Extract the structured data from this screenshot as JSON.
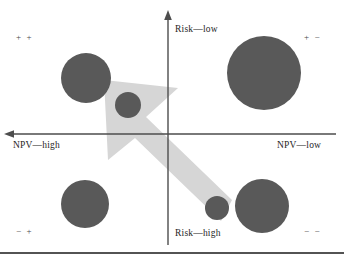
{
  "figure": {
    "title": "",
    "background": "#ffffff",
    "width": 344,
    "height": 263
  },
  "axes": {
    "vertical": {
      "label_top": "Risk—low",
      "label_bottom": "Risk—high",
      "color": "#4d4d4d",
      "x": 168,
      "y_top": 14,
      "y_bottom": 245,
      "arrow_at": "top"
    },
    "horizontal": {
      "label_left": "NPV—high",
      "label_right": "NPV—low",
      "color": "#4d4d4d",
      "y": 134,
      "x_left": 8,
      "x_right": 336,
      "arrow_at": "left"
    }
  },
  "quadrant_signs": {
    "top_left": "+ +",
    "top_right": "+ −",
    "bottom_left": "− +",
    "bottom_right": "− −"
  },
  "footer_rule": {
    "y": 253,
    "color": "#1a1a1a",
    "thickness": 1.6
  },
  "chart_data": {
    "type": "scatter",
    "title": "",
    "xlabel": "NPV",
    "ylabel": "Risk",
    "xlim": [
      0,
      344
    ],
    "ylim": [
      0,
      263
    ],
    "grid": false,
    "legend": null,
    "axis_directions": {
      "x_left": "NPV—high",
      "x_right": "NPV—low",
      "y_top": "Risk—low",
      "y_bottom": "Risk—high"
    },
    "quadrant_labels": [
      "+ +",
      "+ −",
      "− +",
      "− −"
    ],
    "bubble_color": "#595959",
    "bubbles": [
      {
        "name": "bubble-top-left-large",
        "quadrant": "+ +",
        "cx": 86,
        "cy": 78,
        "r": 25
      },
      {
        "name": "bubble-center-small",
        "quadrant": "+ +",
        "cx": 128,
        "cy": 105,
        "r": 13
      },
      {
        "name": "bubble-top-right-large",
        "quadrant": "+ −",
        "cx": 264,
        "cy": 73,
        "r": 37
      },
      {
        "name": "bubble-bottom-left-medium",
        "quadrant": "− +",
        "cx": 85,
        "cy": 204,
        "r": 24
      },
      {
        "name": "bubble-bottom-mid-small",
        "quadrant": "− −",
        "cx": 217,
        "cy": 208,
        "r": 12
      },
      {
        "name": "bubble-bottom-right-large",
        "quadrant": "− −",
        "cx": 262,
        "cy": 206,
        "r": 27
      }
    ],
    "arrow": {
      "name": "direction-arrow",
      "color": "#d6d6d6",
      "points_from": [
        228,
        220
      ],
      "points_to": [
        104,
        80
      ],
      "description": "large translucent arrow pointing up-left toward the ++ quadrant"
    },
    "annotation": "Bubble positions map projects by NPV (horizontal) and Risk (vertical); the arrow indicates movement toward the high-NPV / low-risk quadrant."
  }
}
